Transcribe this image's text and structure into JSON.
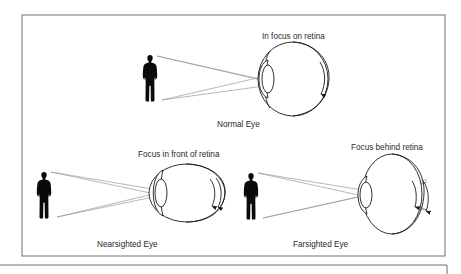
{
  "diagram": {
    "panels": [
      {
        "id": "normal",
        "caption": "Normal Eye",
        "focus_label": "In focus on retina"
      },
      {
        "id": "nearsighted",
        "caption": "Nearsighted Eye",
        "focus_label": "Focus in front of retina"
      },
      {
        "id": "farsighted",
        "caption": "Farsighted Eye",
        "focus_label": "Focus behind retina"
      }
    ],
    "colors": {
      "frame": "#6e6e6e",
      "rays": "#9a9a9a",
      "ink": "#1a1a1a",
      "background": "#ffffff"
    }
  }
}
